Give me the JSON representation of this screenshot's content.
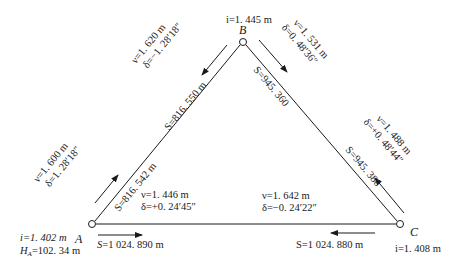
{
  "diagram": {
    "title": "",
    "stations": {
      "A": {
        "name": "A",
        "i": "i=1. 402 m",
        "H": "H",
        "H_sub": "A",
        "H_val": "=102. 34 m"
      },
      "B": {
        "name": "B",
        "i": "i=1. 445 m"
      },
      "C": {
        "name": "C",
        "i": "i=1. 408 m"
      }
    },
    "edges": {
      "AB": {
        "S_near_A": "S=816. 542 m",
        "S_near_B": "S=816. 550 m",
        "from_A": {
          "v": "ν=1. 600 m",
          "delta": "δ=1. 28′18″"
        },
        "from_B": {
          "v": "ν=1. 620 m",
          "delta": "δ=−1. 28′18″"
        }
      },
      "BC": {
        "S_near_B": "S=945. 360",
        "S_near_C": "S=945. 386",
        "from_B": {
          "v": "ν=1. 531 m",
          "delta": "δ=0. 48′36″"
        },
        "from_C": {
          "v": "ν=1. 488 m",
          "delta": "δ=+0. 48′44″"
        }
      },
      "AC": {
        "S_near_A": "S=1 024. 890 m",
        "S_near_C": "S=1 024. 880 m",
        "from_A": {
          "v": "ν=1. 446 m",
          "delta": "δ=+0. 24′45″"
        },
        "from_C": {
          "v": "ν=1. 642 m",
          "delta": "δ=−0. 24′22″"
        }
      }
    },
    "colors": {
      "line": "#1a1a1a",
      "background": "#ffffff"
    }
  }
}
